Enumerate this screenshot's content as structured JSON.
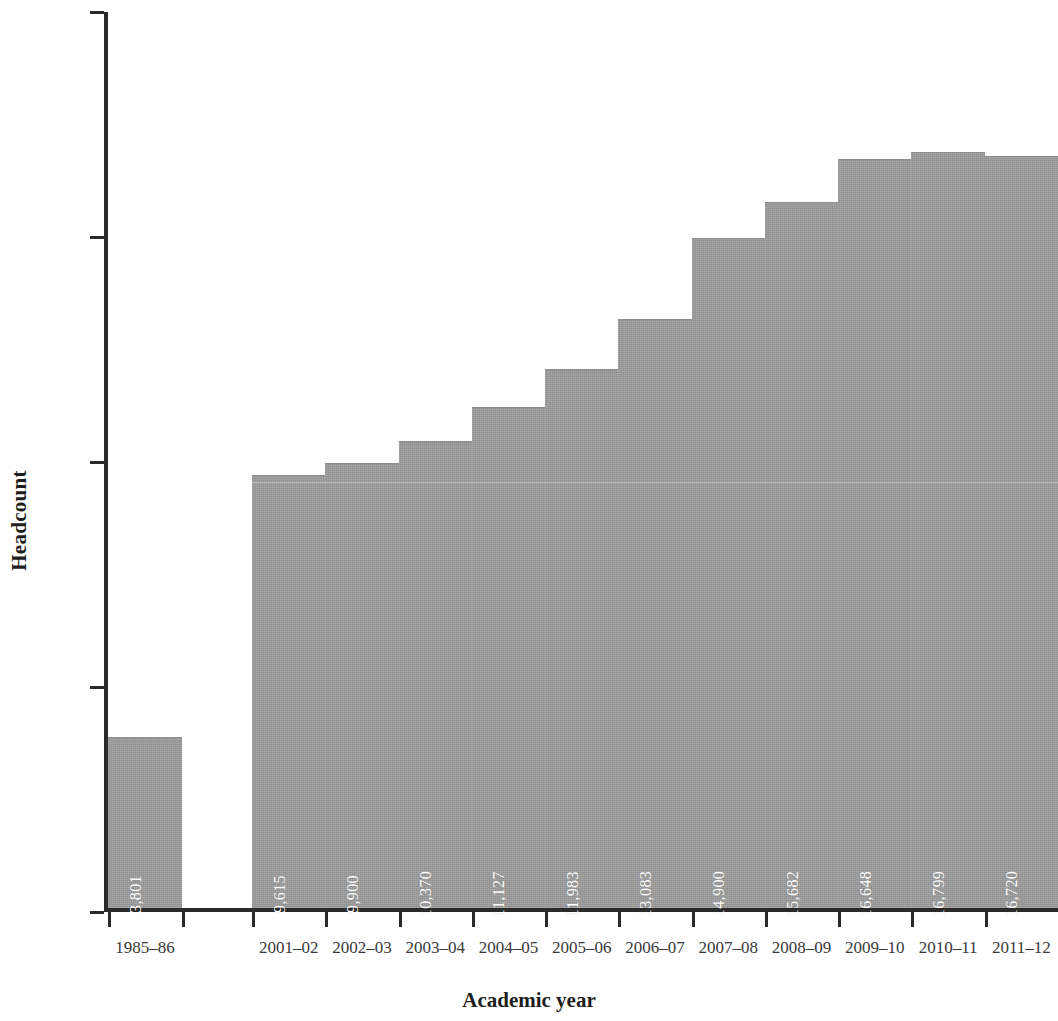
{
  "chart_data": {
    "type": "bar",
    "title": "",
    "xlabel": "Academic year",
    "ylabel": "Headcount",
    "categories": [
      "1985–86",
      "2001–02",
      "2002–03",
      "2003–04",
      "2004–05",
      "2005–06",
      "2006–07",
      "2007–08",
      "2008–09",
      "2009–10",
      "2010–11",
      "2011–12"
    ],
    "values": [
      3801,
      9615,
      9900,
      10370,
      11127,
      11983,
      13083,
      14900,
      15682,
      16648,
      16799,
      16720
    ],
    "value_labels": [
      "3,801",
      "9,615",
      "9,900",
      "10,370",
      "11,127",
      "11,983",
      "13,083",
      "14,900",
      "15,682",
      "16,648",
      "16,799",
      "16,720"
    ],
    "ylim": [
      0,
      20000
    ],
    "ytick_values": [
      0,
      5000,
      10000,
      15000,
      20000
    ],
    "ytick_labels": [
      "0",
      "5,000",
      "10,000",
      "15,000",
      "20,000"
    ],
    "grid": false,
    "legend": false,
    "bar_color": "#9b9b9b",
    "value_label_color": "#ffffff",
    "axis_color": "#2a2a2a",
    "gap_after_index": 0
  },
  "axes": {
    "y_title": "Headcount",
    "x_title": "Academic year"
  }
}
